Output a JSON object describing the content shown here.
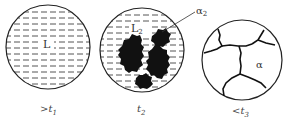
{
  "diagram": {
    "panels": [
      {
        "id": "liquid",
        "region_label": "L",
        "caption_prefix": ">",
        "caption_var": "t",
        "caption_sub": "1"
      },
      {
        "id": "mixed",
        "region_label": "L",
        "region_label_sub": "2",
        "phase_label": "α",
        "phase_label_sub": "2",
        "caption_prefix": "",
        "caption_var": "t",
        "caption_sub": "2"
      },
      {
        "id": "solid",
        "region_label": "α",
        "caption_prefix": "<",
        "caption_var": "t",
        "caption_sub": "3"
      }
    ],
    "colors": {
      "line": "#222222",
      "dash": "#555555",
      "solid": "#111111"
    }
  }
}
